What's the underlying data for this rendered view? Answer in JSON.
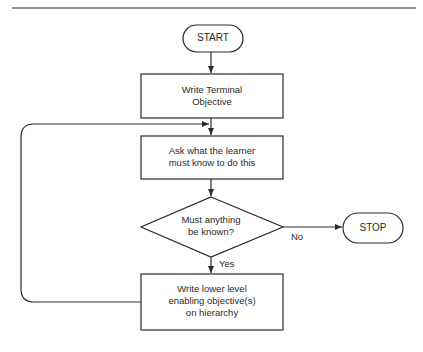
{
  "diagram": {
    "type": "flowchart",
    "nodes": {
      "start": {
        "shape": "terminator",
        "label": "START"
      },
      "terminal_objective": {
        "shape": "process",
        "label_lines": [
          "Write Terminal",
          "Objective"
        ]
      },
      "ask_learner": {
        "shape": "process",
        "label_lines": [
          "Ask what the learner",
          "must know to do this"
        ]
      },
      "decision": {
        "shape": "decision",
        "label_lines": [
          "Must anything",
          "be known?"
        ]
      },
      "stop": {
        "shape": "terminator",
        "label": "STOP"
      },
      "enabling_objectives": {
        "shape": "process",
        "label_lines": [
          "Write lower level",
          "enabling objective(s)",
          "on hierarchy"
        ]
      }
    },
    "edges": {
      "no_label": "No",
      "yes_label": "Yes"
    },
    "colors": {
      "stroke": "#2a2a2a",
      "background": "#ffffff"
    }
  }
}
